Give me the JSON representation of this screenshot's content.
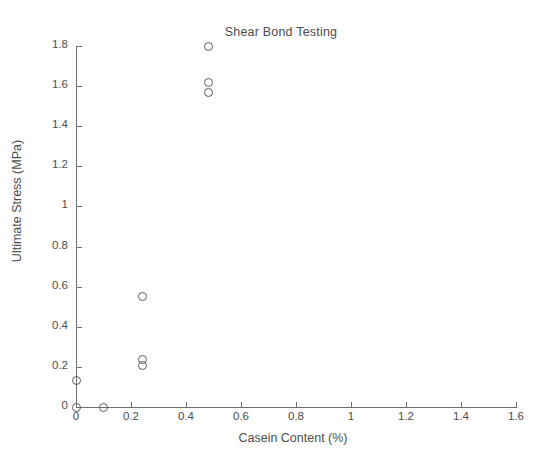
{
  "chart_data": {
    "type": "scatter",
    "title": "Shear Bond Testing",
    "xlabel": "Casein Content (%)",
    "ylabel": "Ultimate Stress (MPa)",
    "xlim": [
      0,
      1.6
    ],
    "ylim": [
      0,
      1.8
    ],
    "grid": false,
    "legend": null,
    "marker": "open-circle",
    "marker_color": "#5b5b5b",
    "xticks": [
      0,
      0.2,
      0.4,
      0.6,
      0.8,
      1,
      1.2,
      1.4,
      1.6
    ],
    "xticklabels": [
      "0",
      "0.2",
      "0.4",
      "0.6",
      "0.8",
      "1",
      "1.2",
      "1.4",
      "1.6"
    ],
    "yticks": [
      0,
      0.2,
      0.4,
      0.6,
      0.8,
      1,
      1.2,
      1.4,
      1.6,
      1.8
    ],
    "yticklabels": [
      "0",
      "0.2",
      "0.4",
      "0.6",
      "0.8",
      "1",
      "1.2",
      "1.4",
      "1.6",
      "1.8"
    ],
    "series": [
      {
        "name": "Ultimate Stress",
        "points": [
          {
            "x": 0,
            "y": 0.13
          },
          {
            "x": 0,
            "y": 0.0
          },
          {
            "x": 0.1,
            "y": 0.0
          },
          {
            "x": 0.24,
            "y": 0.55
          },
          {
            "x": 0.24,
            "y": 0.235
          },
          {
            "x": 0.24,
            "y": 0.205
          },
          {
            "x": 0.48,
            "y": 1.8
          },
          {
            "x": 0.48,
            "y": 1.62
          },
          {
            "x": 0.48,
            "y": 1.57
          }
        ]
      }
    ]
  },
  "figure": {
    "background_color": "#ffffff",
    "axis_color": "#6e6e6e",
    "text_color": "#4d4d4d"
  }
}
